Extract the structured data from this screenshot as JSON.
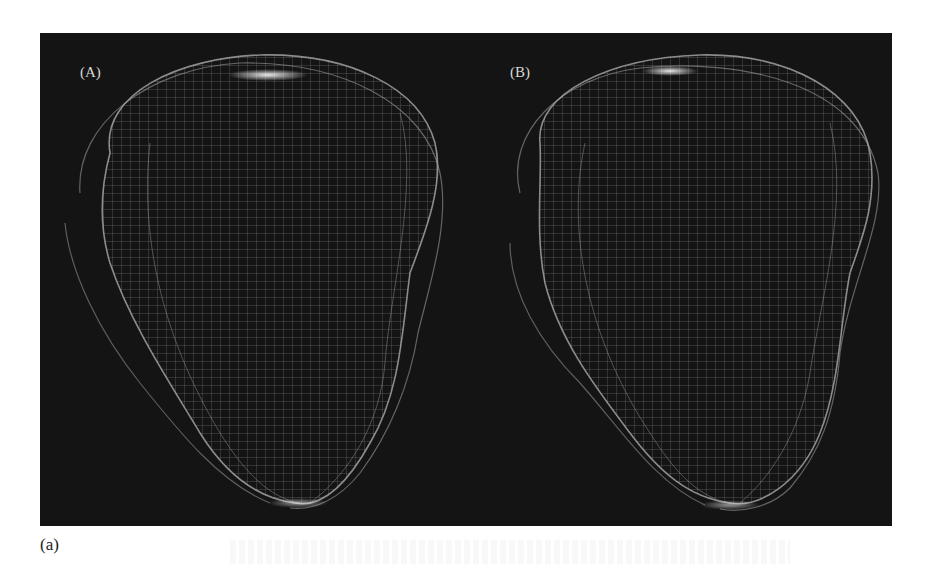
{
  "figure": {
    "panels": [
      {
        "label": "(A)",
        "description": "wireframe mesh model A"
      },
      {
        "label": "(B)",
        "description": "wireframe mesh model B"
      }
    ],
    "subfigure_caption": "(a)",
    "colors": {
      "background": "#141414",
      "mesh": "#bdbdbd",
      "highlight": "#ffffff",
      "page": "#ffffff"
    }
  }
}
